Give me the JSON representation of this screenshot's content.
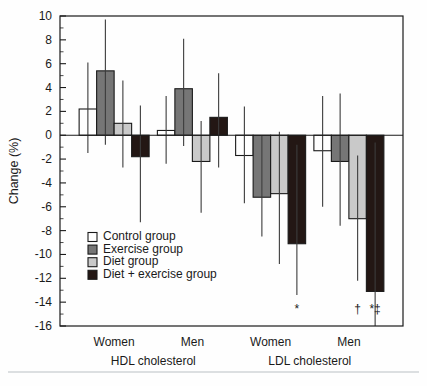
{
  "chart_data": {
    "type": "bar",
    "title": "",
    "xlabel": "",
    "ylabel": "Change (%)",
    "ylim": [
      -16,
      10
    ],
    "ytick_step": 2,
    "yticks": [
      "10",
      "8",
      "6",
      "4",
      "2",
      "0",
      "-2",
      "-4",
      "-6",
      "-8",
      "-10",
      "-12",
      "-14",
      "-16"
    ],
    "grid": false,
    "legend_position": "inside-lower-left",
    "categories": [
      "Women",
      "Men",
      "Women",
      "Men"
    ],
    "supercategories": [
      "HDL cholesterol",
      "LDL cholesterol"
    ],
    "series": [
      {
        "name": "Control group",
        "color": "#ffffff",
        "values": [
          2.2,
          0.4,
          -1.7,
          -1.3
        ],
        "err_low": [
          -1.5,
          -2.4,
          -5.7,
          -6.0
        ],
        "err_high": [
          6.1,
          3.3,
          2.4,
          3.3
        ]
      },
      {
        "name": "Exercise group",
        "color": "#767676",
        "values": [
          5.4,
          3.9,
          -5.2,
          -2.2
        ],
        "err_low": [
          -0.8,
          -0.9,
          -8.5,
          -7.6
        ],
        "err_high": [
          9.7,
          8.1,
          0.0,
          3.5
        ]
      },
      {
        "name": "Diet group",
        "color": "#c9c9c9",
        "values": [
          1.0,
          -2.2,
          -4.9,
          -7.0
        ],
        "err_low": [
          -2.7,
          -6.5,
          -10.8,
          -12.2
        ],
        "err_high": [
          4.6,
          1.2,
          0.3,
          -1.7
        ]
      },
      {
        "name": "Diet + exercise group",
        "color": "#231714",
        "values": [
          -1.8,
          1.5,
          -9.1,
          -13.1
        ],
        "err_low": [
          -7.3,
          -2.7,
          -13.4,
          -16.0
        ],
        "err_high": [
          2.5,
          5.2,
          -0.8,
          -0.6
        ]
      }
    ],
    "annotations": [
      {
        "text": "*",
        "group": 2,
        "series": 3,
        "meaning": "significance-marker"
      },
      {
        "text": "†",
        "group": 3,
        "series": 2,
        "meaning": "significance-marker"
      },
      {
        "text": "*‡",
        "group": 3,
        "series": 3,
        "meaning": "significance-marker"
      }
    ]
  },
  "legend": {
    "items": [
      {
        "label": "Control group"
      },
      {
        "label": "Exercise group"
      },
      {
        "label": "Diet group"
      },
      {
        "label": "Diet + exercise group"
      }
    ]
  }
}
